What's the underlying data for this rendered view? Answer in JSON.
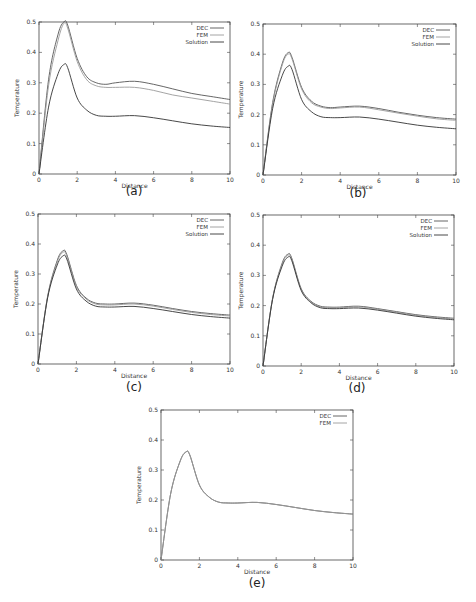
{
  "figure": {
    "common": {
      "xlabel": "Distance",
      "ylabel": "Temperature",
      "xlim": [
        0,
        10
      ],
      "ylim": [
        0,
        0.5
      ],
      "xticks": [
        "0",
        "2",
        "4",
        "6",
        "8",
        "10"
      ],
      "yticks": [
        "0",
        "0.1",
        "0.2",
        "0.3",
        "0.4",
        "0.5"
      ],
      "line_colors": {
        "DEC": "#555555",
        "FEM": "#9a9a9a",
        "Solution": "#333333"
      }
    }
  },
  "chart_data": [
    {
      "id": "a",
      "caption": "(a)",
      "type": "line",
      "title": "",
      "xlabel": "Distance",
      "ylabel": "Temperature",
      "xlim": [
        0,
        10
      ],
      "ylim": [
        0,
        0.5
      ],
      "grid": false,
      "legend_position": "upper right",
      "legend": [
        "DEC",
        "FEM",
        "Solution"
      ],
      "x": [
        0,
        0.5,
        1.0,
        1.3,
        1.5,
        2.0,
        2.5,
        3.0,
        3.5,
        4.0,
        5.0,
        6.0,
        7.0,
        8.0,
        9.0,
        10.0
      ],
      "series": [
        {
          "name": "DEC",
          "values": [
            0,
            0.31,
            0.46,
            0.5,
            0.49,
            0.38,
            0.32,
            0.3,
            0.295,
            0.3,
            0.305,
            0.295,
            0.28,
            0.265,
            0.255,
            0.245
          ]
        },
        {
          "name": "FEM",
          "values": [
            0,
            0.29,
            0.44,
            0.495,
            0.48,
            0.37,
            0.31,
            0.29,
            0.285,
            0.285,
            0.285,
            0.275,
            0.26,
            0.25,
            0.24,
            0.23
          ]
        },
        {
          "name": "Solution",
          "values": [
            0,
            0.22,
            0.33,
            0.36,
            0.35,
            0.25,
            0.21,
            0.193,
            0.19,
            0.19,
            0.192,
            0.185,
            0.175,
            0.165,
            0.158,
            0.153
          ]
        }
      ]
    },
    {
      "id": "b",
      "caption": "(b)",
      "type": "line",
      "title": "",
      "xlabel": "Distance",
      "ylabel": "Temperature",
      "xlim": [
        0,
        10
      ],
      "ylim": [
        0,
        0.5
      ],
      "grid": false,
      "legend_position": "upper right",
      "legend": [
        "DEC",
        "FEM",
        "Solution"
      ],
      "x": [
        0,
        0.5,
        1.0,
        1.3,
        1.5,
        2.0,
        2.5,
        3.0,
        3.5,
        4.0,
        5.0,
        6.0,
        7.0,
        8.0,
        9.0,
        10.0
      ],
      "series": [
        {
          "name": "DEC",
          "values": [
            0,
            0.24,
            0.37,
            0.405,
            0.39,
            0.29,
            0.245,
            0.228,
            0.223,
            0.225,
            0.228,
            0.22,
            0.208,
            0.198,
            0.19,
            0.185
          ]
        },
        {
          "name": "FEM",
          "values": [
            0,
            0.235,
            0.365,
            0.4,
            0.385,
            0.285,
            0.24,
            0.225,
            0.22,
            0.222,
            0.225,
            0.216,
            0.205,
            0.195,
            0.186,
            0.181
          ]
        },
        {
          "name": "Solution",
          "values": [
            0,
            0.22,
            0.33,
            0.36,
            0.35,
            0.25,
            0.21,
            0.193,
            0.19,
            0.19,
            0.192,
            0.185,
            0.175,
            0.165,
            0.158,
            0.153
          ]
        }
      ]
    },
    {
      "id": "c",
      "caption": "(c)",
      "type": "line",
      "title": "",
      "xlabel": "Distance",
      "ylabel": "Temperature",
      "xlim": [
        0,
        10
      ],
      "ylim": [
        0,
        0.5
      ],
      "grid": false,
      "legend_position": "upper right",
      "legend": [
        "DEC",
        "FEM",
        "Solution"
      ],
      "x": [
        0,
        0.5,
        1.0,
        1.3,
        1.5,
        2.0,
        2.5,
        3.0,
        3.5,
        4.0,
        5.0,
        6.0,
        7.0,
        8.0,
        9.0,
        10.0
      ],
      "series": [
        {
          "name": "DEC",
          "values": [
            0,
            0.225,
            0.345,
            0.377,
            0.365,
            0.262,
            0.22,
            0.203,
            0.2,
            0.2,
            0.203,
            0.196,
            0.185,
            0.175,
            0.168,
            0.163
          ]
        },
        {
          "name": "FEM",
          "values": [
            0,
            0.223,
            0.34,
            0.372,
            0.36,
            0.258,
            0.217,
            0.2,
            0.197,
            0.197,
            0.2,
            0.193,
            0.182,
            0.172,
            0.165,
            0.16
          ]
        },
        {
          "name": "Solution",
          "values": [
            0,
            0.22,
            0.33,
            0.36,
            0.35,
            0.25,
            0.21,
            0.193,
            0.19,
            0.19,
            0.192,
            0.185,
            0.175,
            0.165,
            0.158,
            0.153
          ]
        }
      ]
    },
    {
      "id": "d",
      "caption": "(d)",
      "type": "line",
      "title": "",
      "xlabel": "Distance",
      "ylabel": "Temperature",
      "xlim": [
        0,
        10
      ],
      "ylim": [
        0,
        0.5
      ],
      "grid": false,
      "legend_position": "upper right",
      "legend": [
        "DEC",
        "FEM",
        "Solution"
      ],
      "x": [
        0,
        0.5,
        1.0,
        1.3,
        1.5,
        2.0,
        2.5,
        3.0,
        3.5,
        4.0,
        5.0,
        6.0,
        7.0,
        8.0,
        9.0,
        10.0
      ],
      "series": [
        {
          "name": "DEC",
          "values": [
            0,
            0.223,
            0.34,
            0.37,
            0.358,
            0.256,
            0.215,
            0.198,
            0.195,
            0.195,
            0.198,
            0.19,
            0.18,
            0.17,
            0.163,
            0.158
          ]
        },
        {
          "name": "FEM",
          "values": [
            0,
            0.222,
            0.337,
            0.366,
            0.355,
            0.254,
            0.213,
            0.196,
            0.193,
            0.193,
            0.196,
            0.188,
            0.178,
            0.168,
            0.161,
            0.156
          ]
        },
        {
          "name": "Solution",
          "values": [
            0,
            0.22,
            0.33,
            0.36,
            0.35,
            0.25,
            0.21,
            0.193,
            0.19,
            0.19,
            0.192,
            0.185,
            0.175,
            0.165,
            0.158,
            0.153
          ]
        }
      ]
    },
    {
      "id": "e",
      "caption": "(e)",
      "type": "line",
      "title": "",
      "xlabel": "Distance",
      "ylabel": "Temperature",
      "xlim": [
        0,
        10
      ],
      "ylim": [
        0,
        0.5
      ],
      "grid": false,
      "legend_position": "upper right",
      "legend": [
        "DEC",
        "FEM"
      ],
      "x": [
        0,
        0.5,
        1.0,
        1.3,
        1.5,
        2.0,
        2.5,
        3.0,
        3.5,
        4.0,
        5.0,
        6.0,
        7.0,
        8.0,
        9.0,
        10.0
      ],
      "series": [
        {
          "name": "DEC",
          "values": [
            0,
            0.22,
            0.33,
            0.36,
            0.35,
            0.25,
            0.21,
            0.193,
            0.19,
            0.19,
            0.192,
            0.185,
            0.175,
            0.165,
            0.158,
            0.153
          ]
        },
        {
          "name": "FEM",
          "values": [
            0,
            0.22,
            0.33,
            0.36,
            0.35,
            0.25,
            0.21,
            0.193,
            0.19,
            0.19,
            0.192,
            0.185,
            0.175,
            0.165,
            0.158,
            0.153
          ]
        }
      ]
    }
  ]
}
